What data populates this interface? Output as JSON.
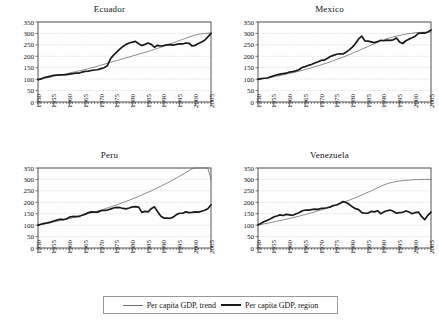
{
  "figure": {
    "width": 439,
    "height": 326,
    "background": "#ffffff"
  },
  "legend": {
    "position": "bottom-center",
    "entries": [
      {
        "label": "Per capita GDP, trend",
        "style": "thin-line",
        "color": "#6f6f6f"
      },
      {
        "label": "Per capita GDP, region",
        "style": "thick-line",
        "color": "#1a1a1a"
      }
    ]
  },
  "axes": {
    "ylabel": "",
    "xlabel": "",
    "ylim": [
      0,
      350
    ],
    "yticks": [
      0,
      50,
      100,
      150,
      200,
      250,
      300,
      350
    ],
    "xlim": [
      1950,
      2005
    ],
    "xticks": [
      1950,
      1955,
      1960,
      1965,
      1970,
      1975,
      1980,
      1985,
      1990,
      1995,
      2000,
      2005
    ],
    "grid": true,
    "grid_color": "#c9c9c9",
    "frame_color": "#555555"
  },
  "chart_data": [
    {
      "type": "line",
      "title": "Ecuador",
      "xlabel": "",
      "ylabel": "",
      "xlim": [
        1950,
        2005
      ],
      "ylim": [
        0,
        350
      ],
      "yticks": [
        0,
        50,
        100,
        150,
        200,
        250,
        300,
        350
      ],
      "xticks": [
        1950,
        1955,
        1960,
        1965,
        1970,
        1975,
        1980,
        1985,
        1990,
        1995,
        2000,
        2005
      ],
      "grid": true,
      "x": [
        1950,
        1951,
        1952,
        1953,
        1954,
        1955,
        1956,
        1957,
        1958,
        1959,
        1960,
        1961,
        1962,
        1963,
        1964,
        1965,
        1966,
        1967,
        1968,
        1969,
        1970,
        1971,
        1972,
        1973,
        1974,
        1975,
        1976,
        1977,
        1978,
        1979,
        1980,
        1981,
        1982,
        1983,
        1984,
        1985,
        1986,
        1987,
        1988,
        1989,
        1990,
        1991,
        1992,
        1993,
        1994,
        1995,
        1996,
        1997,
        1998,
        1999,
        2000,
        2001,
        2002,
        2003,
        2004,
        2005
      ],
      "series": [
        {
          "name": "Per capita GDP, region",
          "values": [
            98,
            101,
            107,
            110,
            113,
            117,
            118,
            119,
            119,
            120,
            122,
            124,
            126,
            126,
            131,
            134,
            135,
            138,
            140,
            141,
            146,
            150,
            158,
            188,
            205,
            218,
            231,
            243,
            252,
            258,
            262,
            265,
            255,
            247,
            252,
            258,
            252,
            240,
            248,
            245,
            247,
            250,
            251,
            249,
            252,
            254,
            254,
            258,
            257,
            245,
            248,
            256,
            263,
            270,
            285,
            300
          ]
        },
        {
          "name": "Per capita GDP, trend",
          "values": [
            98,
            101,
            103,
            106,
            109,
            112,
            115,
            118,
            121,
            124,
            127,
            130,
            133,
            136,
            139,
            142,
            146,
            150,
            153,
            157,
            161,
            165,
            169,
            173,
            177,
            181,
            185,
            189,
            193,
            197,
            201,
            205,
            209,
            213,
            217,
            221,
            226,
            230,
            235,
            239,
            244,
            249,
            254,
            259,
            264,
            269,
            274,
            279,
            284,
            289,
            293,
            296,
            298,
            300,
            301,
            302
          ]
        }
      ]
    },
    {
      "type": "line",
      "title": "Mexico",
      "xlabel": "",
      "ylabel": "",
      "xlim": [
        1950,
        2005
      ],
      "ylim": [
        0,
        350
      ],
      "yticks": [
        0,
        50,
        100,
        150,
        200,
        250,
        300,
        350
      ],
      "xticks": [
        1950,
        1955,
        1960,
        1965,
        1970,
        1975,
        1980,
        1985,
        1990,
        1995,
        2000,
        2005
      ],
      "grid": true,
      "x": [
        1950,
        1951,
        1952,
        1953,
        1954,
        1955,
        1956,
        1957,
        1958,
        1959,
        1960,
        1961,
        1962,
        1963,
        1964,
        1965,
        1966,
        1967,
        1968,
        1969,
        1970,
        1971,
        1972,
        1973,
        1974,
        1975,
        1976,
        1977,
        1978,
        1979,
        1980,
        1981,
        1982,
        1983,
        1984,
        1985,
        1986,
        1987,
        1988,
        1989,
        1990,
        1991,
        1992,
        1993,
        1994,
        1995,
        1996,
        1997,
        1998,
        1999,
        2000,
        2001,
        2002,
        2003,
        2004,
        2005
      ],
      "series": [
        {
          "name": "Per capita GDP, region",
          "values": [
            99,
            102,
            104,
            105,
            110,
            115,
            119,
            122,
            124,
            126,
            131,
            133,
            136,
            141,
            151,
            155,
            160,
            164,
            171,
            175,
            182,
            183,
            190,
            199,
            204,
            209,
            211,
            210,
            218,
            228,
            240,
            256,
            276,
            288,
            267,
            266,
            263,
            260,
            264,
            270,
            268,
            271,
            270,
            272,
            280,
            263,
            256,
            268,
            275,
            281,
            288,
            300,
            302,
            301,
            306,
            315
          ]
        },
        {
          "name": "Per capita GDP, trend",
          "values": [
            99,
            101,
            103,
            105,
            108,
            110,
            113,
            116,
            119,
            122,
            125,
            128,
            131,
            135,
            138,
            142,
            146,
            150,
            154,
            158,
            162,
            167,
            171,
            176,
            181,
            186,
            191,
            196,
            202,
            207,
            213,
            219,
            225,
            231,
            237,
            243,
            249,
            255,
            261,
            267,
            272,
            277,
            281,
            285,
            288,
            291,
            294,
            297,
            299,
            301,
            303,
            304,
            305,
            305,
            306,
            306
          ]
        }
      ]
    },
    {
      "type": "line",
      "title": "Peru",
      "xlabel": "",
      "ylabel": "",
      "xlim": [
        1950,
        2005
      ],
      "ylim": [
        0,
        350
      ],
      "yticks": [
        0,
        50,
        100,
        150,
        200,
        250,
        300,
        350
      ],
      "xticks": [
        1950,
        1955,
        1960,
        1965,
        1970,
        1975,
        1980,
        1985,
        1990,
        1995,
        2000,
        2005
      ],
      "grid": true,
      "x": [
        1950,
        1951,
        1952,
        1953,
        1954,
        1955,
        1956,
        1957,
        1958,
        1959,
        1960,
        1961,
        1962,
        1963,
        1964,
        1965,
        1966,
        1967,
        1968,
        1969,
        1970,
        1971,
        1972,
        1973,
        1974,
        1975,
        1976,
        1977,
        1978,
        1979,
        1980,
        1981,
        1982,
        1983,
        1984,
        1985,
        1986,
        1987,
        1988,
        1989,
        1990,
        1991,
        1992,
        1993,
        1994,
        1995,
        1996,
        1997,
        1998,
        1999,
        2000,
        2001,
        2002,
        2003,
        2004,
        2005
      ],
      "series": [
        {
          "name": "Per capita GDP, region",
          "values": [
            100,
            104,
            108,
            110,
            113,
            118,
            122,
            126,
            124,
            127,
            135,
            138,
            137,
            138,
            143,
            148,
            155,
            158,
            157,
            157,
            163,
            165,
            166,
            170,
            175,
            178,
            177,
            173,
            171,
            175,
            180,
            181,
            179,
            156,
            160,
            158,
            172,
            180,
            160,
            140,
            131,
            131,
            130,
            135,
            146,
            152,
            152,
            158,
            155,
            156,
            158,
            157,
            161,
            165,
            172,
            189
          ]
        },
        {
          "name": "Per capita GDP, trend",
          "values": [
            100,
            103,
            105,
            108,
            111,
            114,
            117,
            120,
            123,
            126,
            129,
            132,
            136,
            139,
            143,
            146,
            150,
            154,
            158,
            162,
            166,
            170,
            175,
            179,
            184,
            189,
            194,
            199,
            204,
            209,
            215,
            220,
            226,
            232,
            238,
            244,
            250,
            257,
            263,
            270,
            277,
            284,
            291,
            299,
            306,
            314,
            322,
            330,
            339,
            347,
            356,
            365,
            374,
            383,
            392,
            300
          ]
        }
      ]
    },
    {
      "type": "line",
      "title": "Venezuela",
      "xlabel": "",
      "ylabel": "",
      "xlim": [
        1950,
        2005
      ],
      "ylim": [
        0,
        350
      ],
      "yticks": [
        0,
        50,
        100,
        150,
        200,
        250,
        300,
        350
      ],
      "xticks": [
        1950,
        1955,
        1960,
        1965,
        1970,
        1975,
        1980,
        1985,
        1990,
        1995,
        2000,
        2005
      ],
      "grid": true,
      "x": [
        1950,
        1951,
        1952,
        1953,
        1954,
        1955,
        1956,
        1957,
        1958,
        1959,
        1960,
        1961,
        1962,
        1963,
        1964,
        1965,
        1966,
        1967,
        1968,
        1969,
        1970,
        1971,
        1972,
        1973,
        1974,
        1975,
        1976,
        1977,
        1978,
        1979,
        1980,
        1981,
        1982,
        1983,
        1984,
        1985,
        1986,
        1987,
        1988,
        1989,
        1990,
        1991,
        1992,
        1993,
        1994,
        1995,
        1996,
        1997,
        1998,
        1999,
        2000,
        2001,
        2002,
        2003,
        2004,
        2005
      ],
      "series": [
        {
          "name": "Per capita GDP, region",
          "values": [
            101,
            108,
            116,
            121,
            128,
            136,
            140,
            145,
            142,
            147,
            145,
            143,
            149,
            154,
            162,
            166,
            166,
            168,
            170,
            169,
            173,
            174,
            176,
            180,
            186,
            188,
            195,
            203,
            199,
            191,
            180,
            172,
            168,
            155,
            152,
            153,
            160,
            158,
            163,
            150,
            158,
            163,
            166,
            161,
            152,
            155,
            156,
            162,
            158,
            150,
            155,
            157,
            138,
            124,
            143,
            157
          ]
        },
        {
          "name": "Per capita GDP, trend",
          "values": [
            101,
            103,
            106,
            108,
            111,
            114,
            117,
            120,
            123,
            126,
            129,
            132,
            136,
            139,
            143,
            146,
            150,
            154,
            158,
            162,
            166,
            170,
            175,
            179,
            184,
            189,
            194,
            199,
            204,
            209,
            215,
            220,
            226,
            232,
            238,
            244,
            250,
            257,
            263,
            270,
            276,
            281,
            285,
            288,
            291,
            293,
            295,
            296,
            297,
            298,
            299,
            299,
            300,
            300,
            300,
            300
          ]
        }
      ]
    }
  ]
}
